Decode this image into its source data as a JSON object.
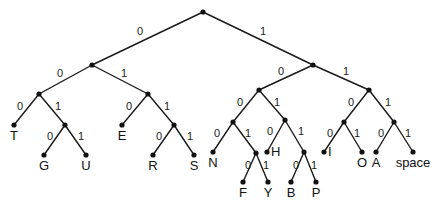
{
  "figure": {
    "kind": "binary-code-tree",
    "background_color": "#ffffff",
    "line_color": "#1a1a1a",
    "node_color": "#111111",
    "text_color": "#111111"
  },
  "nodes": [
    {
      "id": "root",
      "x": 203,
      "y": 12,
      "type": "internal"
    },
    {
      "id": "n0",
      "x": 92,
      "y": 65,
      "type": "internal"
    },
    {
      "id": "n1",
      "x": 313,
      "y": 65,
      "type": "internal"
    },
    {
      "id": "n00",
      "x": 39,
      "y": 94,
      "type": "internal"
    },
    {
      "id": "n01",
      "x": 148,
      "y": 94,
      "type": "internal"
    },
    {
      "id": "n10",
      "x": 259,
      "y": 90,
      "type": "internal"
    },
    {
      "id": "n11",
      "x": 369,
      "y": 90,
      "type": "internal"
    },
    {
      "id": "n001",
      "x": 65,
      "y": 125,
      "type": "internal"
    },
    {
      "id": "n011",
      "x": 174,
      "y": 125,
      "type": "internal"
    },
    {
      "id": "n100",
      "x": 233,
      "y": 122,
      "type": "internal"
    },
    {
      "id": "n101",
      "x": 285,
      "y": 120,
      "type": "internal"
    },
    {
      "id": "n110",
      "x": 344,
      "y": 122,
      "type": "internal"
    },
    {
      "id": "n111",
      "x": 394,
      "y": 122,
      "type": "internal"
    },
    {
      "id": "n1001",
      "x": 256,
      "y": 153,
      "type": "internal"
    },
    {
      "id": "n1011",
      "x": 304,
      "y": 152,
      "type": "internal"
    }
  ],
  "leaves": [
    {
      "id": "T",
      "label": "T",
      "x": 14,
      "y": 125,
      "code": "000",
      "label_pos": "below"
    },
    {
      "id": "G",
      "label": "G",
      "x": 44,
      "y": 155,
      "code": "0010",
      "label_pos": "below"
    },
    {
      "id": "U",
      "label": "U",
      "x": 86,
      "y": 155,
      "code": "0011",
      "label_pos": "below"
    },
    {
      "id": "E",
      "label": "E",
      "x": 122,
      "y": 125,
      "code": "010",
      "label_pos": "below"
    },
    {
      "id": "R",
      "label": "R",
      "x": 153,
      "y": 155,
      "code": "0110",
      "label_pos": "below"
    },
    {
      "id": "S",
      "label": "S",
      "x": 194,
      "y": 155,
      "code": "0111",
      "label_pos": "below"
    },
    {
      "id": "N",
      "label": "N",
      "x": 213,
      "y": 152,
      "code": "1000",
      "label_pos": "below"
    },
    {
      "id": "F",
      "label": "F",
      "x": 243,
      "y": 182,
      "code": "10010",
      "label_pos": "below"
    },
    {
      "id": "Y",
      "label": "Y",
      "x": 268,
      "y": 182,
      "code": "10011",
      "label_pos": "below"
    },
    {
      "id": "H",
      "label": "H",
      "x": 267,
      "y": 152,
      "code": "1010",
      "label_pos": "right"
    },
    {
      "id": "B",
      "label": "B",
      "x": 291,
      "y": 182,
      "code": "10110",
      "label_pos": "below"
    },
    {
      "id": "P",
      "label": "P",
      "x": 316,
      "y": 182,
      "code": "10111",
      "label_pos": "below"
    },
    {
      "id": "I",
      "label": "I",
      "x": 324,
      "y": 152,
      "code": "1100",
      "label_pos": "right"
    },
    {
      "id": "O",
      "label": "O",
      "x": 362,
      "y": 152,
      "code": "1101",
      "label_pos": "below"
    },
    {
      "id": "A",
      "label": "A",
      "x": 376,
      "y": 152,
      "code": "1110",
      "label_pos": "below"
    },
    {
      "id": "space",
      "label": "space",
      "x": 413,
      "y": 152,
      "code": "1111",
      "label_pos": "below"
    }
  ],
  "edges": [
    {
      "from": "root",
      "to": "n0",
      "bit": "0",
      "label_x": 140,
      "label_y": 32
    },
    {
      "from": "root",
      "to": "n1",
      "bit": "1",
      "label_x": 263,
      "label_y": 32
    },
    {
      "from": "n0",
      "to": "n00",
      "bit": "0",
      "label_x": 60,
      "label_y": 74
    },
    {
      "from": "n0",
      "to": "n01",
      "bit": "1",
      "label_x": 124,
      "label_y": 74
    },
    {
      "from": "n1",
      "to": "n10",
      "bit": "0",
      "label_x": 281,
      "label_y": 72
    },
    {
      "from": "n1",
      "to": "n11",
      "bit": "1",
      "label_x": 346,
      "label_y": 72
    },
    {
      "from": "n00",
      "to": "T",
      "bit": "0",
      "label_x": 20,
      "label_y": 107
    },
    {
      "from": "n00",
      "to": "n001",
      "bit": "1",
      "label_x": 58,
      "label_y": 107
    },
    {
      "from": "n01",
      "to": "E",
      "bit": "0",
      "label_x": 129,
      "label_y": 107
    },
    {
      "from": "n01",
      "to": "n011",
      "bit": "1",
      "label_x": 167,
      "label_y": 107
    },
    {
      "from": "n10",
      "to": "n100",
      "bit": "0",
      "label_x": 240,
      "label_y": 103
    },
    {
      "from": "n10",
      "to": "n101",
      "bit": "1",
      "label_x": 277,
      "label_y": 103
    },
    {
      "from": "n11",
      "to": "n110",
      "bit": "0",
      "label_x": 351,
      "label_y": 103
    },
    {
      "from": "n11",
      "to": "n111",
      "bit": "1",
      "label_x": 388,
      "label_y": 103
    },
    {
      "from": "n001",
      "to": "G",
      "bit": "0",
      "label_x": 50,
      "label_y": 137
    },
    {
      "from": "n001",
      "to": "U",
      "bit": "1",
      "label_x": 81,
      "label_y": 137
    },
    {
      "from": "n011",
      "to": "R",
      "bit": "0",
      "label_x": 159,
      "label_y": 137
    },
    {
      "from": "n011",
      "to": "S",
      "bit": "1",
      "label_x": 190,
      "label_y": 137
    },
    {
      "from": "n100",
      "to": "N",
      "bit": "0",
      "label_x": 217,
      "label_y": 134
    },
    {
      "from": "n100",
      "to": "n1001",
      "bit": "1",
      "label_x": 248,
      "label_y": 134
    },
    {
      "from": "n101",
      "to": "H",
      "bit": "0",
      "label_x": 270,
      "label_y": 132
    },
    {
      "from": "n101",
      "to": "n1011",
      "bit": "1",
      "label_x": 301,
      "label_y": 132
    },
    {
      "from": "n110",
      "to": "I",
      "bit": "0",
      "label_x": 330,
      "label_y": 134
    },
    {
      "from": "n110",
      "to": "O",
      "bit": "1",
      "label_x": 357,
      "label_y": 134
    },
    {
      "from": "n111",
      "to": "A",
      "bit": "0",
      "label_x": 381,
      "label_y": 134
    },
    {
      "from": "n111",
      "to": "space",
      "bit": "1",
      "label_x": 408,
      "label_y": 134
    },
    {
      "from": "n1001",
      "to": "F",
      "bit": "0",
      "label_x": 248,
      "label_y": 166
    },
    {
      "from": "n1001",
      "to": "Y",
      "bit": "1",
      "label_x": 266,
      "label_y": 166
    },
    {
      "from": "n1011",
      "to": "B",
      "bit": "0",
      "label_x": 296,
      "label_y": 166
    },
    {
      "from": "n1011",
      "to": "P",
      "bit": "1",
      "label_x": 314,
      "label_y": 166
    }
  ]
}
